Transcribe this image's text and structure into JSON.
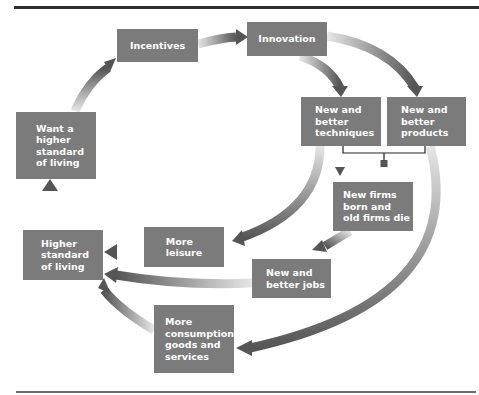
{
  "diagram": {
    "type": "flowchart",
    "colors": {
      "box_fill": "#7b7b7b",
      "box_text": "#ffffff",
      "arrow_dark": "#555555",
      "arrow_light": "#dddddd",
      "rule": "#2e2e2e"
    },
    "nodes": {
      "incentives": {
        "lines": [
          "Incentives"
        ]
      },
      "innovation": {
        "lines": [
          "Innovation"
        ]
      },
      "techniques": {
        "lines": [
          "New and",
          "better",
          "techniques"
        ]
      },
      "products": {
        "lines": [
          "New and",
          "better",
          "products"
        ]
      },
      "firms": {
        "lines": [
          "New firms",
          "born and",
          "old firms die"
        ]
      },
      "leisure": {
        "lines": [
          "More",
          "leisure"
        ]
      },
      "jobs": {
        "lines": [
          "New and",
          "better jobs"
        ]
      },
      "higher_standard": {
        "lines": [
          "Higher",
          "standard",
          "of living"
        ]
      },
      "want_higher": {
        "lines": [
          "Want a",
          "higher",
          "standard",
          "of living"
        ]
      },
      "consumption": {
        "lines": [
          "More",
          "consumption",
          "goods and",
          "services"
        ]
      }
    },
    "edges": [
      {
        "from": "incentives",
        "to": "innovation"
      },
      {
        "from": "innovation",
        "to": "techniques"
      },
      {
        "from": "innovation",
        "to": "products"
      },
      {
        "from": "techniques",
        "to": "firms"
      },
      {
        "from": "products",
        "to": "firms"
      },
      {
        "from": "techniques",
        "to": "leisure"
      },
      {
        "from": "firms",
        "to": "jobs"
      },
      {
        "from": "leisure",
        "to": "higher_standard"
      },
      {
        "from": "jobs",
        "to": "higher_standard"
      },
      {
        "from": "products",
        "to": "consumption"
      },
      {
        "from": "consumption",
        "to": "higher_standard"
      },
      {
        "from": "higher_standard",
        "to": "want_higher"
      },
      {
        "from": "want_higher",
        "to": "incentives"
      }
    ]
  }
}
